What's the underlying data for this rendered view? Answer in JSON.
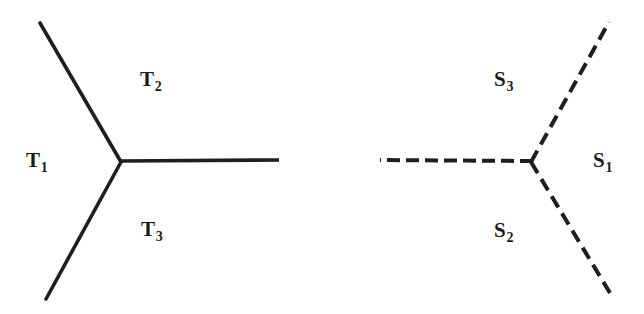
{
  "figure": {
    "background_color": "#ffffff",
    "stroke_color": "#1f1f1f",
    "width": 644,
    "height": 314,
    "panels": [
      {
        "id": "left-panel",
        "name": "solid-tripod",
        "line_style": "solid",
        "stroke_width": 3.6,
        "junction": {
          "x": 121,
          "y": 162
        },
        "edges": [
          {
            "id": "upper-left-edge",
            "from": {
              "x": 121,
              "y": 162
            },
            "to": {
              "x": 40,
              "y": 23
            }
          },
          {
            "id": "lower-left-edge",
            "from": {
              "x": 121,
              "y": 162
            },
            "to": {
              "x": 46,
              "y": 299
            }
          },
          {
            "id": "horizontal-edge",
            "from": {
              "x": 121,
              "y": 162
            },
            "to": {
              "x": 279,
              "y": 160
            }
          }
        ],
        "labels": [
          {
            "id": "t1",
            "base": "T",
            "sub": "1",
            "text": "T1"
          },
          {
            "id": "t2",
            "base": "T",
            "sub": "2",
            "text": "T2"
          },
          {
            "id": "t3",
            "base": "T",
            "sub": "3",
            "text": "T3"
          }
        ]
      },
      {
        "id": "right-panel",
        "name": "dashed-tripod",
        "line_style": "dashed",
        "stroke_width": 4.0,
        "dash_pattern": "12 6",
        "junction": {
          "x": 531,
          "y": 162
        },
        "edges": [
          {
            "id": "upper-right-edge",
            "from": {
              "x": 531,
              "y": 162
            },
            "to": {
              "x": 609,
              "y": 22
            }
          },
          {
            "id": "lower-right-edge",
            "from": {
              "x": 531,
              "y": 162
            },
            "to": {
              "x": 613,
              "y": 298
            }
          },
          {
            "id": "horizontal-edge",
            "from": {
              "x": 531,
              "y": 162
            },
            "to": {
              "x": 380,
              "y": 160
            }
          }
        ],
        "labels": [
          {
            "id": "s1",
            "base": "S",
            "sub": "1",
            "text": "S1"
          },
          {
            "id": "s2",
            "base": "S",
            "sub": "2",
            "text": "S2"
          },
          {
            "id": "s3",
            "base": "S",
            "sub": "3",
            "text": "S3"
          }
        ]
      }
    ]
  },
  "labels": {
    "t1": {
      "base": "T",
      "sub": "1"
    },
    "t2": {
      "base": "T",
      "sub": "2"
    },
    "t3": {
      "base": "T",
      "sub": "3"
    },
    "s1": {
      "base": "S",
      "sub": "1"
    },
    "s2": {
      "base": "S",
      "sub": "2"
    },
    "s3": {
      "base": "S",
      "sub": "3"
    }
  }
}
